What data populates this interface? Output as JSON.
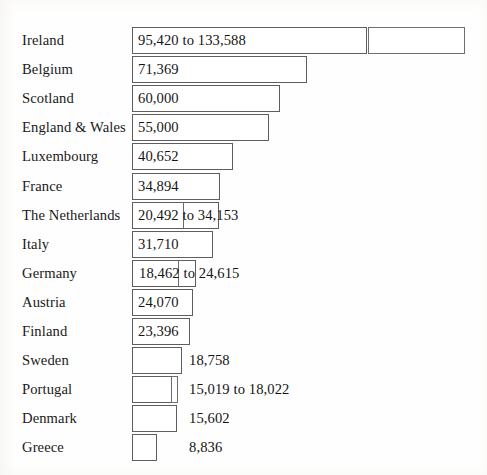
{
  "chart_data": {
    "type": "bar",
    "orientation": "horizontal",
    "title": "",
    "subtitle": "",
    "xlabel": "",
    "ylabel": "",
    "grid": false,
    "legend": null,
    "axis_visible": false,
    "tick_labels": [],
    "xlim": [
      0,
      133588
    ],
    "categories": [
      "Ireland",
      "Belgium",
      "Scotland",
      "England & Wales",
      "Luxembourg",
      "France",
      "The Netherlands",
      "Italy",
      "Germany",
      "Austria",
      "Finland",
      "Sweden",
      "Portugal",
      "Denmark",
      "Greece"
    ],
    "values": [
      133588,
      71369,
      60000,
      55000,
      40652,
      34894,
      34153,
      31710,
      24615,
      24070,
      23396,
      18758,
      18022,
      15602,
      8836
    ],
    "value_labels": [
      "95,420 to 133,588",
      "71,369",
      "60,000",
      "55,000",
      "40,652",
      "34,894",
      "20,492 to 34,153",
      "31,710",
      "18,462 to 24,615",
      "24,070",
      "23,396",
      "18,758",
      "15,019 to 18,022",
      "15,602",
      "8,836"
    ],
    "ranges": [
      {
        "category": "Ireland",
        "low": 95420,
        "high": 133588
      },
      {
        "category": "The Netherlands",
        "low": 20492,
        "high": 34153
      },
      {
        "category": "Germany",
        "low": 18462,
        "high": 24615
      },
      {
        "category": "Portugal",
        "low": 15019,
        "high": 18022
      }
    ]
  },
  "rows": [
    {
      "label": "Ireland",
      "value_label": "95,420 to 133,588",
      "bar_left": 132,
      "bar_width": 235,
      "ext_left": 368,
      "ext_width": 97,
      "has_divider": false,
      "label_inside": true,
      "value_x": 138
    },
    {
      "label": "Belgium",
      "value_label": "71,369",
      "bar_left": 132,
      "bar_width": 175,
      "ext_left": 0,
      "ext_width": 0,
      "has_divider": false,
      "label_inside": true,
      "value_x": 138
    },
    {
      "label": "Scotland",
      "value_label": "60,000",
      "bar_left": 132,
      "bar_width": 148,
      "ext_left": 0,
      "ext_width": 0,
      "has_divider": false,
      "label_inside": true,
      "value_x": 138
    },
    {
      "label": "England & Wales",
      "value_label": "55,000",
      "bar_left": 132,
      "bar_width": 137,
      "ext_left": 0,
      "ext_width": 0,
      "has_divider": false,
      "label_inside": true,
      "value_x": 138
    },
    {
      "label": "Luxembourg",
      "value_label": "40,652",
      "bar_left": 132,
      "bar_width": 101,
      "ext_left": 0,
      "ext_width": 0,
      "has_divider": false,
      "label_inside": true,
      "value_x": 138
    },
    {
      "label": "France",
      "value_label": "34,894",
      "bar_left": 132,
      "bar_width": 88,
      "ext_left": 0,
      "ext_width": 0,
      "has_divider": false,
      "label_inside": true,
      "value_x": 138
    },
    {
      "label": "The Netherlands",
      "value_label": "20,492 to 34,153",
      "bar_left": 132,
      "bar_width": 87,
      "ext_left": 0,
      "ext_width": 0,
      "has_divider": true,
      "divider_x": 183,
      "label_inside": true,
      "value_x": 138
    },
    {
      "label": "Italy",
      "value_label": "31,710",
      "bar_left": 132,
      "bar_width": 81,
      "ext_left": 0,
      "ext_width": 0,
      "has_divider": false,
      "label_inside": true,
      "value_x": 138
    },
    {
      "label": "Germany",
      "value_label": "18,462 to 24,615",
      "bar_left": 132,
      "bar_width": 64,
      "ext_left": 0,
      "ext_width": 0,
      "has_divider": true,
      "divider_x": 178,
      "label_inside": true,
      "value_x": 139
    },
    {
      "label": "Austria",
      "value_label": "24,070",
      "bar_left": 132,
      "bar_width": 61,
      "ext_left": 0,
      "ext_width": 0,
      "has_divider": false,
      "label_inside": true,
      "value_x": 138
    },
    {
      "label": "Finland",
      "value_label": "23,396",
      "bar_left": 132,
      "bar_width": 58,
      "ext_left": 0,
      "ext_width": 0,
      "has_divider": false,
      "label_inside": true,
      "value_x": 138
    },
    {
      "label": "Sweden",
      "value_label": "18,758",
      "bar_left": 132,
      "bar_width": 50,
      "ext_left": 0,
      "ext_width": 0,
      "has_divider": false,
      "label_inside": false,
      "value_x": 189
    },
    {
      "label": "Portugal",
      "value_label": "15,019 to 18,022",
      "bar_left": 132,
      "bar_width": 40,
      "ext_left": 171,
      "ext_width": 7,
      "has_divider": false,
      "label_inside": false,
      "value_x": 189
    },
    {
      "label": "Denmark",
      "value_label": "15,602",
      "bar_left": 132,
      "bar_width": 45,
      "ext_left": 0,
      "ext_width": 0,
      "has_divider": false,
      "label_inside": false,
      "value_x": 189
    },
    {
      "label": "Greece",
      "value_label": "8,836",
      "bar_left": 132,
      "bar_width": 25,
      "ext_left": 0,
      "ext_width": 0,
      "has_divider": false,
      "label_inside": false,
      "value_x": 189
    }
  ],
  "layout": {
    "row_top_start": 26,
    "row_height": 29.1
  },
  "colors": {
    "bar_fill": "#ffffff",
    "bar_stroke": "#5e5e5e",
    "text": "#141414",
    "background": "#fefefe"
  }
}
